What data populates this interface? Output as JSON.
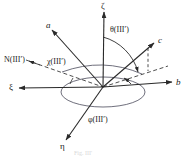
{
  "figure": {
    "caption": "Fig. III'",
    "origin": {
      "x": 103,
      "y": 87
    },
    "stroke_color": "#2a2a2a",
    "dash_color": "#3a3a3a",
    "background": "#ffffff"
  },
  "axes": [
    {
      "id": "zeta",
      "label": "ζ",
      "type": "greek",
      "style": "solid",
      "label_x": 101,
      "label_y": 2,
      "tip_x": 104,
      "tip_y": 13,
      "desc": "vertical-up-axis"
    },
    {
      "id": "xi",
      "label": "ξ",
      "type": "greek",
      "style": "solid",
      "label_x": 9,
      "label_y": 83,
      "tip_x": 20,
      "tip_y": 88,
      "desc": "left-axis"
    },
    {
      "id": "b",
      "label": "b",
      "type": "latin",
      "style": "solid",
      "label_x": 176,
      "label_y": 78,
      "tip_x": 172,
      "tip_y": 82,
      "desc": "right-axis"
    },
    {
      "id": "eta",
      "label": "η",
      "type": "greek",
      "style": "solid",
      "label_x": 60,
      "label_y": 142,
      "tip_x": 66,
      "tip_y": 140,
      "desc": "lower-left-axis"
    },
    {
      "id": "a",
      "label": "a",
      "type": "latin",
      "style": "solid",
      "label_x": 46,
      "label_y": 21,
      "tip_x": 52,
      "tip_y": 31,
      "desc": "upper-left-axis"
    },
    {
      "id": "c",
      "label": "c",
      "type": "latin",
      "style": "solid",
      "label_x": 158,
      "label_y": 36,
      "tip_x": 154,
      "tip_y": 44,
      "desc": "upper-right-axis"
    }
  ],
  "angles": [
    {
      "id": "theta",
      "label": "θ(III′)",
      "label_x": 110,
      "label_y": 26,
      "desc": "polar-angle-from-zeta-to-c"
    },
    {
      "id": "phi",
      "label": "φ(III′)",
      "label_x": 88,
      "label_y": 116,
      "desc": "azimuthal-angle-in-horizontal-plane"
    }
  ],
  "node_line": {
    "id": "node",
    "label": "N(III′)",
    "label_x": 4,
    "label_y": 56,
    "chi_label": "χ(III′)",
    "chi_label_x": 47,
    "chi_label_y": 58,
    "desc": "line-of-nodes-dashed"
  }
}
